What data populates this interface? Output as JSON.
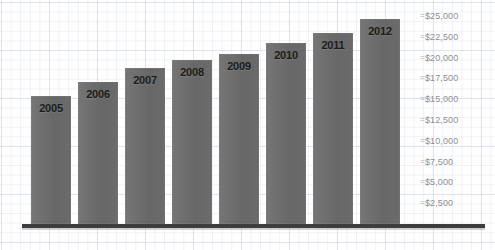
{
  "page": {
    "scan_header_text": ""
  },
  "chart_data": {
    "type": "bar",
    "title": "",
    "subtitle": "",
    "xlabel": "",
    "ylabel": "",
    "categories": [
      "2005",
      "2006",
      "2007",
      "2008",
      "2009",
      "2010",
      "2011",
      "2012"
    ],
    "values": [
      15400,
      17100,
      18800,
      19700,
      20400,
      21800,
      22900,
      24600
    ],
    "series": [
      {
        "name": "",
        "values": [
          15400,
          17100,
          18800,
          19700,
          20400,
          21800,
          22900,
          24600
        ]
      }
    ],
    "ylim": [
      0,
      25000
    ],
    "ytick_values": [
      25000,
      22500,
      20000,
      17500,
      15000,
      12500,
      10000,
      7500,
      5000,
      2500
    ],
    "ytick_labels": [
      "$25,000",
      "$22,500",
      "$20,000",
      "$17,500",
      "$15,000",
      "$12,500",
      "$10,000",
      "$7,500",
      "$5,000",
      "$2,500"
    ],
    "ytick_marker": "=",
    "axis_position": "right",
    "grid": true,
    "grid_style": "graph-paper",
    "legend": false,
    "legend_position": "none",
    "bar_color": "#6d6d6d",
    "label_color": "#1c1c1c",
    "axis_label_color": "#8e8e92",
    "baseline_color": "#3d3d3d",
    "background_color": "#ffffff",
    "grid_color": "#aab4cd",
    "bars": [
      {
        "label": "2005",
        "value": 15400
      },
      {
        "label": "2006",
        "value": 17100
      },
      {
        "label": "2007",
        "value": 18800
      },
      {
        "label": "2008",
        "value": 19700
      },
      {
        "label": "2009",
        "value": 20400
      },
      {
        "label": "2010",
        "value": 21800
      },
      {
        "label": "2011",
        "value": 22900
      },
      {
        "label": "2012",
        "value": 24600
      }
    ]
  }
}
